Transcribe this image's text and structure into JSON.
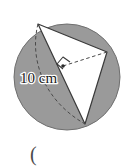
{
  "figure": {
    "canvas": {
      "width": 134,
      "height": 166,
      "background": "#ffffff"
    },
    "circle": {
      "name": "shaded-circle",
      "center_x": 67,
      "center_y": 77,
      "radius": 53,
      "fill": "#9a9a9a",
      "stroke": "#6f6f6f",
      "stroke_width": 1
    },
    "triangle": {
      "name": "inscribed-triangle",
      "fill": "#ffffff",
      "stroke": "#3a3a3a",
      "stroke_width": 1.2,
      "vertices": [
        {
          "label": "top-vertex",
          "x": 38,
          "y": 24
        },
        {
          "label": "right-vertex",
          "x": 107,
          "y": 52
        },
        {
          "label": "bottom-vertex",
          "x": 85,
          "y": 124
        }
      ]
    },
    "dashed_lines": [
      {
        "name": "dashed-chord-top-to-bottom",
        "x1": 38,
        "y1": 24,
        "x2": 85,
        "y2": 124
      },
      {
        "name": "dashed-radius-to-right-vertex",
        "x1": 63,
        "y1": 66,
        "x2": 107,
        "y2": 52
      }
    ],
    "center_dot": {
      "name": "center-point",
      "x": 63,
      "y": 66,
      "r": 1.8,
      "fill": "#2a2a2a"
    },
    "right_angle_marker": {
      "name": "right-angle-marker",
      "points": "63,66 55,72 60,79 68,73",
      "stroke": "#3a3a3a"
    },
    "labels": {
      "measurement": "10 cm",
      "measurement_x": 22,
      "measurement_y": 80,
      "paren": "(",
      "paren_x": 31,
      "paren_y": 160
    }
  }
}
